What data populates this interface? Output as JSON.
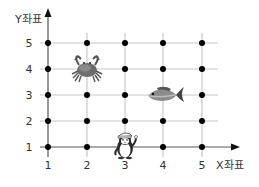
{
  "diagram": {
    "type": "coordinate-grid",
    "x_axis_label": "X좌표",
    "y_axis_label": "Y좌표",
    "x_ticks": [
      "1",
      "2",
      "3",
      "4",
      "5"
    ],
    "y_ticks": [
      "1",
      "2",
      "3",
      "4",
      "5"
    ],
    "grid_color": "#c8c8c8",
    "axis_color": "#555555",
    "dot_color": "#000000",
    "objects": [
      {
        "name": "crab",
        "icon": "crab-icon",
        "x": 2,
        "y": 4
      },
      {
        "name": "fish",
        "icon": "fish-icon",
        "x": 4,
        "y": 3
      },
      {
        "name": "penguin",
        "icon": "penguin-icon",
        "x": 3,
        "y": 1
      }
    ]
  }
}
